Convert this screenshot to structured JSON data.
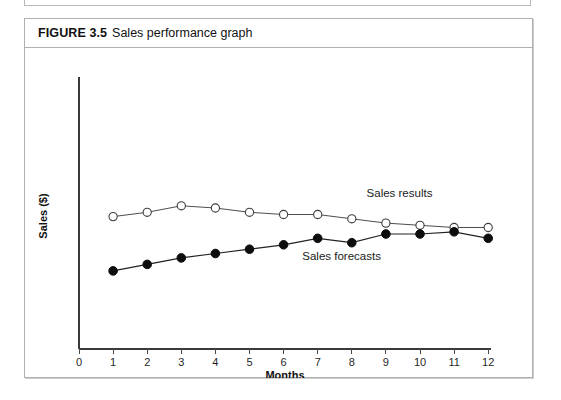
{
  "figure": {
    "number_label": "FIGURE 3.5",
    "title": "Sales performance graph"
  },
  "chart_data": {
    "type": "line",
    "title": "Sales performance graph",
    "xlabel": "Months",
    "ylabel": "Sales ($)",
    "x": [
      1,
      2,
      3,
      4,
      5,
      6,
      7,
      8,
      9,
      10,
      11,
      12
    ],
    "xtick_labels": [
      "0",
      "1",
      "2",
      "3",
      "4",
      "5",
      "6",
      "7",
      "8",
      "9",
      "10",
      "11",
      "12"
    ],
    "xlim": [
      0,
      12
    ],
    "ylim": [
      0,
      100
    ],
    "ytick_labels": [],
    "grid": false,
    "legend_position": "inline-annotation",
    "series": [
      {
        "name": "Sales results",
        "marker": "open-circle",
        "values": [
          61,
          63,
          66,
          65,
          63,
          62,
          62,
          60,
          58,
          57,
          56,
          56
        ],
        "label_x": 9.4,
        "label_y": 70
      },
      {
        "name": "Sales forecasts",
        "marker": "filled-circle",
        "values": [
          36,
          39,
          42,
          44,
          46,
          48,
          51,
          49,
          53,
          53,
          54,
          51
        ],
        "label_x": 7.7,
        "label_y": 41
      }
    ],
    "annotations": [
      {
        "text": "Sales results"
      },
      {
        "text": "Sales forecasts"
      }
    ],
    "colors": {
      "axis": "#3a3a3a",
      "series_results_marker_fill": "#ffffff",
      "series_results_stroke": "#3d3d3d",
      "series_forecasts_fill": "#0d0d0d",
      "frame_border": "#b0b0b0",
      "background": "#ffffff"
    }
  }
}
